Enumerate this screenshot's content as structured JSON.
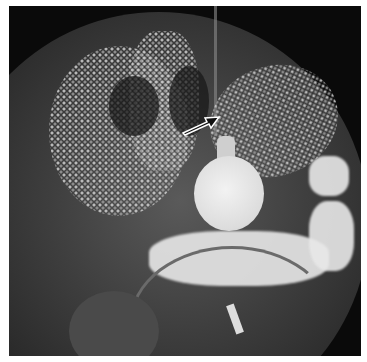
{
  "image": {
    "description": "Fluoroscopic radiograph with barium contrast, circular field of view, balloon filled with contrast, arrow annotation pointing to a catheter/tube",
    "annotations": [
      {
        "type": "arrow",
        "direction": "up-right",
        "color": "#ffffff"
      }
    ],
    "colors": {
      "background": "#ffffff",
      "field_edge": "#0a0a0a",
      "contrast": "#eeeeee"
    }
  }
}
